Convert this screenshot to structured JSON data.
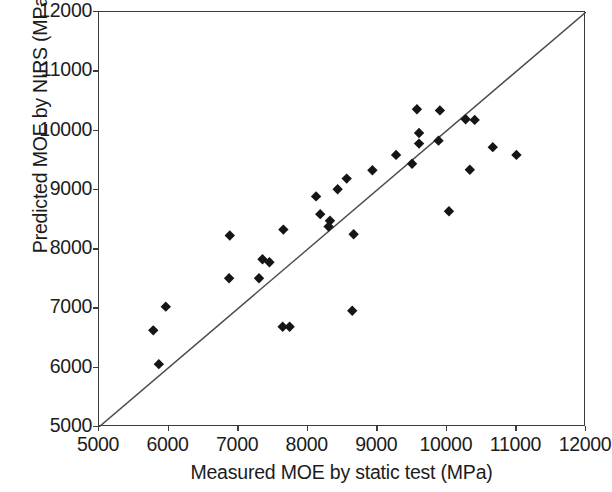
{
  "chart_data": {
    "type": "scatter",
    "title": "",
    "xlabel": "Measured MOE by static test (MPa)",
    "ylabel": "Predicted MOE by NIRS (MPa)",
    "xlim": [
      5000,
      12000
    ],
    "ylim": [
      5000,
      12000
    ],
    "xticks": [
      5000,
      6000,
      7000,
      8000,
      9000,
      10000,
      11000,
      12000
    ],
    "yticks": [
      5000,
      6000,
      7000,
      8000,
      9000,
      10000,
      11000,
      12000
    ],
    "xtick_labels": [
      "5000",
      "6000",
      "7000",
      "8000",
      "9000",
      "10000",
      "11000",
      "12000"
    ],
    "ytick_labels": [
      "5000",
      "6000",
      "7000",
      "8000",
      "9000",
      "10000",
      "11000",
      "12000"
    ],
    "grid": false,
    "legend": null,
    "marker_style": "filled-diamond",
    "marker_color": "#151515",
    "series": [
      {
        "name": "Samples",
        "points": [
          [
            5780,
            6630
          ],
          [
            5960,
            7030
          ],
          [
            5860,
            6060
          ],
          [
            6880,
            8230
          ],
          [
            6870,
            7510
          ],
          [
            7350,
            7830
          ],
          [
            7450,
            7780
          ],
          [
            7300,
            7510
          ],
          [
            7650,
            8330
          ],
          [
            7640,
            6690
          ],
          [
            7740,
            6690
          ],
          [
            8120,
            8890
          ],
          [
            8180,
            8590
          ],
          [
            8320,
            8480
          ],
          [
            8300,
            8380
          ],
          [
            8560,
            9190
          ],
          [
            8430,
            9010
          ],
          [
            8660,
            8250
          ],
          [
            8640,
            6960
          ],
          [
            8930,
            9330
          ],
          [
            9270,
            9590
          ],
          [
            9570,
            10360
          ],
          [
            9600,
            9960
          ],
          [
            9600,
            9780
          ],
          [
            9900,
            10340
          ],
          [
            9500,
            9440
          ],
          [
            9880,
            9830
          ],
          [
            10030,
            8640
          ],
          [
            10270,
            10190
          ],
          [
            10400,
            10180
          ],
          [
            10330,
            9340
          ],
          [
            10660,
            9720
          ],
          [
            11000,
            9590
          ]
        ]
      }
    ],
    "reference_line": {
      "name": "identity-line",
      "type": "1:1",
      "from": [
        5000,
        5000
      ],
      "to": [
        12000,
        12000
      ],
      "color": "#4a4a4a"
    }
  },
  "axes": {
    "x_title": "Measured MOE by static test (MPa)",
    "y_title": "Predicted MOE by NIRS (MPa)"
  }
}
